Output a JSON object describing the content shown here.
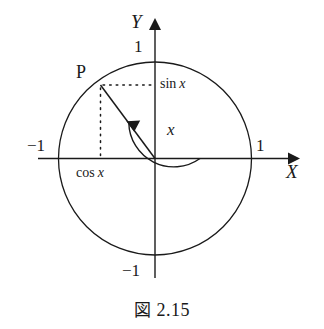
{
  "figure": {
    "caption_symbol": "図",
    "caption_number": "2.15",
    "caption_full": "図 2.15",
    "axes": {
      "x_axis_label": "X",
      "y_axis_label": "Y",
      "x_positive_tick": "1",
      "x_negative_tick": "−1",
      "y_positive_tick": "1",
      "y_negative_tick": "−1"
    },
    "point": {
      "label": "P",
      "x": -0.57,
      "y": 0.76,
      "angle_degrees": 127
    },
    "annotations": {
      "sin_prefix": "sin",
      "sin_var": "x",
      "sin_full": "sin x",
      "cos_prefix": "cos",
      "cos_var": "x",
      "cos_full": "cos x",
      "angle_var": "x"
    },
    "circle": {
      "radius": 1,
      "center_x": 0,
      "center_y": 0
    },
    "colors": {
      "stroke": "#1a1a1a",
      "background": "#ffffff",
      "text": "#1a1a1a"
    }
  }
}
